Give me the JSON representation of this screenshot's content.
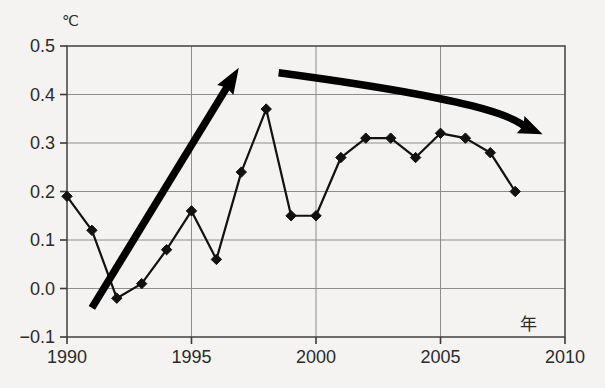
{
  "chart_data": {
    "type": "line",
    "title": "",
    "subtitle": "",
    "xlabel": "年",
    "ylabel": "℃",
    "y_unit_label": "℃",
    "x_unit_label": "年",
    "xlim": [
      1990,
      2010
    ],
    "ylim": [
      -0.1,
      0.5
    ],
    "grid": true,
    "legend": "none",
    "x": [
      1990,
      1991,
      1992,
      1993,
      1994,
      1995,
      1996,
      1997,
      1998,
      1999,
      2000,
      2001,
      2002,
      2003,
      2004,
      2005,
      2006,
      2007,
      2008
    ],
    "values": [
      0.19,
      0.12,
      -0.02,
      0.01,
      0.08,
      0.16,
      0.06,
      0.24,
      0.37,
      0.15,
      0.15,
      0.27,
      0.31,
      0.31,
      0.27,
      0.32,
      0.31,
      0.28,
      0.2
    ],
    "series": [
      {
        "name": "anomaly",
        "marker": "diamond",
        "color": "#111111",
        "values": [
          0.19,
          0.12,
          -0.02,
          0.01,
          0.08,
          0.16,
          0.06,
          0.24,
          0.37,
          0.15,
          0.15,
          0.27,
          0.31,
          0.31,
          0.27,
          0.32,
          0.31,
          0.28,
          0.2
        ]
      }
    ],
    "xticks": [
      1990,
      1995,
      2000,
      2005,
      2010
    ],
    "xtick_labels": [
      "1990",
      "1995",
      "2000",
      "2005",
      "2010"
    ],
    "yticks": [
      -0.1,
      0.0,
      0.1,
      0.2,
      0.3,
      0.4,
      0.5
    ],
    "ytick_labels": [
      "-0.1",
      "0.0",
      "0.1",
      "0.2",
      "0.3",
      "0.4",
      "0.5"
    ],
    "annotations": [
      {
        "name": "rising-trend-arrow",
        "type": "arrow",
        "direction": "up",
        "from": [
          1991.0,
          -0.04
        ],
        "to": [
          1996.9,
          0.455
        ],
        "color": "#000000"
      },
      {
        "name": "falling-trend-arrow",
        "type": "arrow",
        "direction": "down",
        "from": [
          1998.5,
          0.445
        ],
        "to": [
          2009.1,
          0.318
        ],
        "color": "#000000"
      }
    ]
  },
  "axes": {
    "y_unit": "℃",
    "x_unit": "年",
    "y_labels": [
      "0.5",
      "0.4",
      "0.3",
      "0.2",
      "0.1",
      "0.0",
      "-0.1"
    ],
    "x_labels": [
      "1990",
      "1995",
      "2000",
      "2005",
      "2010"
    ]
  }
}
